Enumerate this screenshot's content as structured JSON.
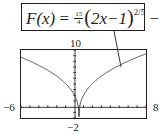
{
  "formula": {
    "lhs": "F(x)",
    "eq": "=",
    "coef_num": "15",
    "coef_den": "4",
    "inner_open": "(",
    "inner": "2x−1",
    "inner_close": ")",
    "exponent": "2/5",
    "minus": "−",
    "const_num": "7",
    "const_den": "4"
  },
  "labels": {
    "ymax": "10",
    "ymin": "−2",
    "xmin": "−6",
    "xmax": "8"
  },
  "colors": {
    "ink": "#231f20",
    "curve": "#3a3a3a",
    "frame": "#231f20"
  },
  "chart_data": {
    "type": "line",
    "xlabel": "",
    "ylabel": "",
    "xlim": [
      -6,
      8
    ],
    "ylim": [
      -2,
      10
    ],
    "grid": false,
    "x_ticks_every": 1,
    "y_ticks_every": 1,
    "window_labels": {
      "xmin": "-6",
      "xmax": "8",
      "ymin": "-2",
      "ymax": "10"
    },
    "annotations": [
      {
        "text": "F(x) = (15/4)(2x−1)^(2/5) − 7/4",
        "points_to": [
          5.2,
          7.0
        ]
      }
    ],
    "series": [
      {
        "name": "F(x)",
        "x": [
          -6,
          -5,
          -4,
          -3,
          -2,
          -1,
          0,
          0.25,
          0.5,
          0.75,
          1,
          2,
          3,
          4,
          5,
          6,
          7,
          8
        ],
        "values": [
          8.71,
          8.08,
          7.39,
          6.6,
          5.68,
          4.57,
          2.0,
          1.03,
          -1.75,
          1.03,
          2.0,
          4.06,
          5.17,
          6.13,
          6.98,
          7.76,
          8.48,
          9.33
        ]
      }
    ]
  }
}
